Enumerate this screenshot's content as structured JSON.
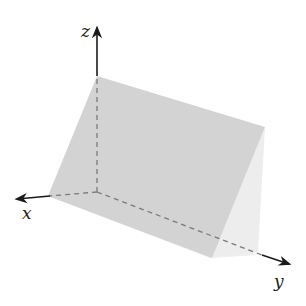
{
  "diagram": {
    "type": "3d-coordinate-plane",
    "axes": {
      "x": {
        "label": "x"
      },
      "y": {
        "label": "y"
      },
      "z": {
        "label": "z"
      }
    },
    "colors": {
      "plane": "#d4d4d4",
      "side_face": "#ececec",
      "floor": "#f0f0f0",
      "axis": "#1a1a1a",
      "dashed": "#7a7a7a"
    }
  }
}
